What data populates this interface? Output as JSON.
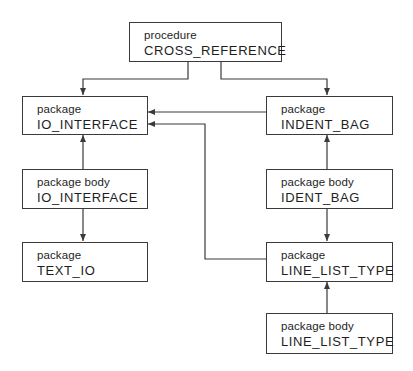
{
  "diagram": {
    "type": "dependency-graph",
    "line_color": "#3a3a3a",
    "nodes": [
      {
        "id": "cross_reference",
        "kind": "procedure",
        "name": "CROSS_REFERENCE"
      },
      {
        "id": "io_interface_pkg",
        "kind": "package",
        "name": "IO_INTERFACE"
      },
      {
        "id": "indent_bag_pkg",
        "kind": "package",
        "name": "INDENT_BAG"
      },
      {
        "id": "io_interface_body",
        "kind": "package body",
        "name": "IO_INTERFACE"
      },
      {
        "id": "ident_bag_body",
        "kind": "package body",
        "name": "IDENT_BAG"
      },
      {
        "id": "text_io_pkg",
        "kind": "package",
        "name": "TEXT_IO"
      },
      {
        "id": "line_list_type_pkg",
        "kind": "package",
        "name": "LINE_LIST_TYPE"
      },
      {
        "id": "line_list_type_body",
        "kind": "package body",
        "name": "LINE_LIST_TYPE"
      }
    ],
    "edges": [
      {
        "from": "cross_reference",
        "to": "io_interface_pkg"
      },
      {
        "from": "cross_reference",
        "to": "indent_bag_pkg"
      },
      {
        "from": "indent_bag_pkg",
        "to": "io_interface_pkg"
      },
      {
        "from": "line_list_type_pkg",
        "to": "io_interface_pkg"
      },
      {
        "from": "io_interface_body",
        "to": "io_interface_pkg"
      },
      {
        "from": "io_interface_body",
        "to": "text_io_pkg"
      },
      {
        "from": "ident_bag_body",
        "to": "indent_bag_pkg"
      },
      {
        "from": "ident_bag_body",
        "to": "line_list_type_pkg"
      },
      {
        "from": "line_list_type_body",
        "to": "line_list_type_pkg"
      }
    ]
  }
}
